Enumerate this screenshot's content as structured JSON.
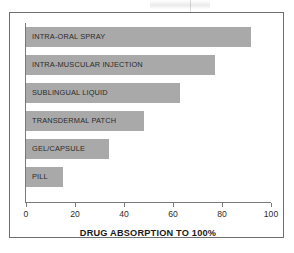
{
  "chart_data": {
    "type": "bar",
    "orientation": "horizontal",
    "title": "",
    "xlabel": "DRUG ABSORPTION TO 100%",
    "ylabel": "",
    "categories": [
      "INTRA-ORAL SPRAY",
      "INTRA-MUSCULAR INJECTION",
      "SUBLINGUAL LIQUID",
      "TRANSDERMAL PATCH",
      "GEL/CAPSULE",
      "PILL"
    ],
    "values": [
      92,
      77,
      63,
      48,
      34,
      15
    ],
    "xlim": [
      0,
      100
    ],
    "xticks": [
      0,
      20,
      40,
      60,
      80,
      100
    ],
    "xtick_labels": [
      "0",
      "20",
      "40",
      "60",
      "80",
      "100"
    ],
    "grid": false,
    "legend": "none",
    "bar_color": "#a9a9a9",
    "axis_color": "#7a7a7a",
    "text_color": "#2b2b2b",
    "frame_color": "#6e6e6e",
    "background": "#ffffff"
  },
  "figure": {
    "axis_title": "DRUG ABSORPTION TO 100%"
  }
}
